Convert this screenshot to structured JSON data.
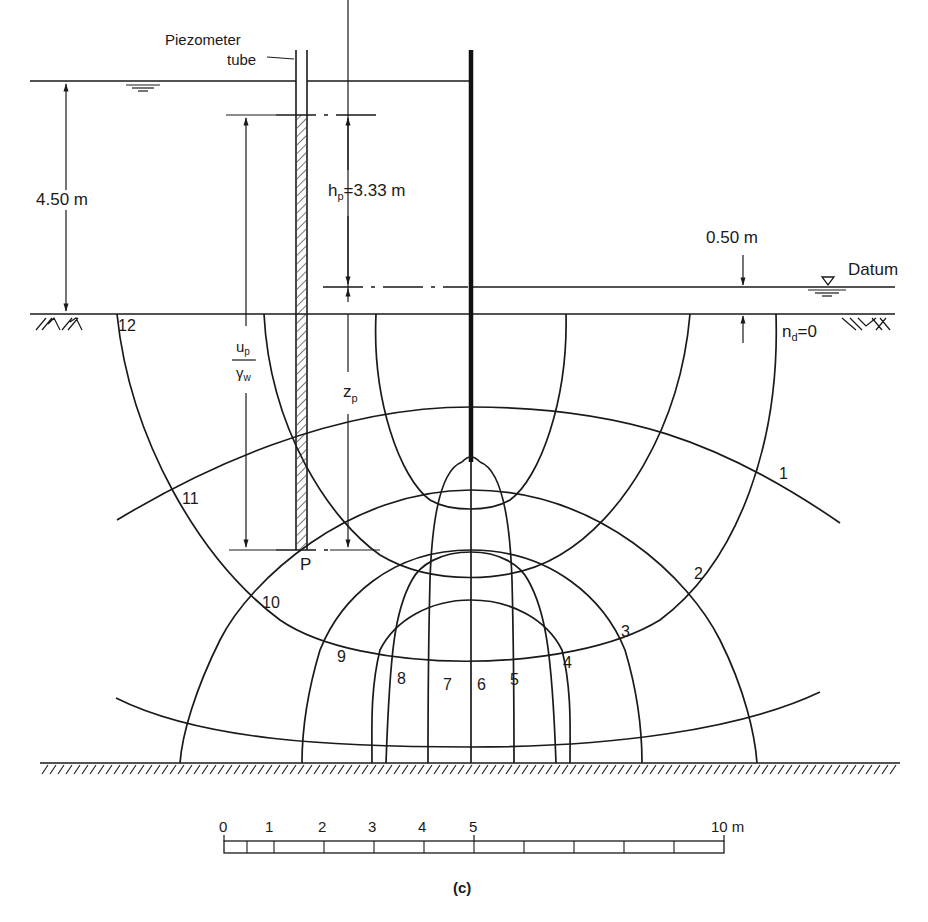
{
  "figure": {
    "caption": "(c)",
    "type": "flow net beneath sheet pile wall",
    "colors": {
      "ink": "#1a1a1a",
      "background": "#ffffff"
    }
  },
  "labels": {
    "piezometer_line1": "Piezometer",
    "piezometer_line2": "tube",
    "upstream_head": "4.50 m",
    "hp_label": "h",
    "hp_sub": "p",
    "hp_value": "=3.33 m",
    "downstream_head": "0.50 m",
    "datum": "Datum",
    "nd_label": "n",
    "nd_sub": "d",
    "nd_value": "=0",
    "up_num": "u",
    "up_num_sub": "p",
    "up_den": "γ",
    "up_den_sub": "w",
    "zp_label": "z",
    "zp_sub": "p",
    "point_p": "P"
  },
  "equipotential_numbers": [
    "1",
    "2",
    "3",
    "4",
    "5",
    "6",
    "7",
    "8",
    "9",
    "10",
    "11",
    "12"
  ],
  "scale_bar": {
    "ticks": [
      "0",
      "1",
      "2",
      "3",
      "4",
      "5",
      "10 m"
    ],
    "unit": "m",
    "length_m": 10
  }
}
